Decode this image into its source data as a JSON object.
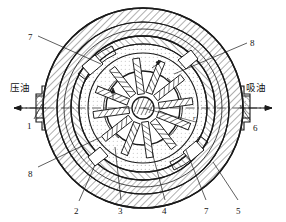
{
  "figure": {
    "type": "mechanical-cross-section",
    "background_color": "#ffffff",
    "line_color": "#1a1a1a"
  },
  "flow_labels": {
    "left": {
      "text": "压油",
      "meaning": "pressure-oil-outlet",
      "arrow_direction": "left"
    },
    "right": {
      "text": "吸油",
      "meaning": "suction-oil-inlet",
      "arrow_direction": "left"
    }
  },
  "callouts": [
    {
      "id": "c7-top",
      "number": "7",
      "x": 28,
      "y": 33
    },
    {
      "id": "c8-top",
      "number": "8",
      "x": 250,
      "y": 39
    },
    {
      "id": "c1",
      "number": "1",
      "x": 27,
      "y": 122
    },
    {
      "id": "c6",
      "number": "6",
      "x": 253,
      "y": 124
    },
    {
      "id": "c8-left",
      "number": "8",
      "x": 28,
      "y": 170
    },
    {
      "id": "c2",
      "number": "2",
      "x": 74,
      "y": 207
    },
    {
      "id": "c3",
      "number": "3",
      "x": 118,
      "y": 207
    },
    {
      "id": "c4",
      "number": "4",
      "x": 162,
      "y": 207
    },
    {
      "id": "c7-bottom",
      "number": "7",
      "x": 204,
      "y": 207
    },
    {
      "id": "c5",
      "number": "5",
      "x": 236,
      "y": 207
    }
  ],
  "center_dimension": {
    "label": "r"
  },
  "geometry": {
    "center_x": 143,
    "center_y": 108,
    "outer_casing_radius": 100,
    "stator_outer_radius": 86,
    "stator_inner_radius": 72,
    "ring_radius": 64,
    "chamber_radius": 55,
    "rotor_radius": 37,
    "hub_radius": 10,
    "vane_count": 12
  },
  "components": {
    "1": "压油口 (pressure port)",
    "2": "泵体 (pump body)",
    "3": "定子 (stator ring)",
    "4": "转子 (rotor)",
    "5": "壳体 (casing)",
    "6": "吸油口 (suction port)",
    "7": "配油盘 (port plate)",
    "8": "叶片 (vane)"
  }
}
